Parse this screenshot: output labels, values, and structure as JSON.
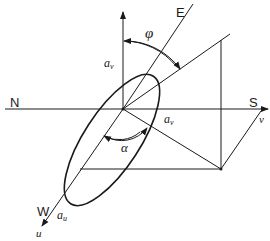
{
  "diagram": {
    "labels": {
      "north": "N",
      "south": "S",
      "east": "E",
      "west": "W",
      "phi": "φ",
      "alpha": "α",
      "u_axis": "u",
      "v_axis": "v",
      "a_v_top": "a",
      "a_v_top_sub": "v",
      "a_v_right": "a",
      "a_v_right_sub": "v",
      "a_u": "a",
      "a_u_sub": "u"
    },
    "colors": {
      "stroke": "#1a1a1a",
      "background": "#ffffff"
    }
  }
}
